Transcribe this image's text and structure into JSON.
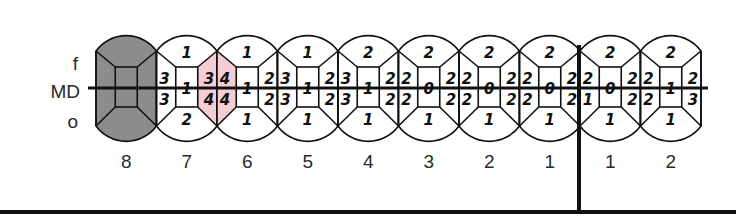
{
  "diagram": {
    "type": "dental-surface-chart",
    "row_labels": {
      "top": "f",
      "middle": "MD",
      "bottom": "o"
    },
    "colors": {
      "missing_fill": "#8c8c8c",
      "highlight_fill": "#f6cdd5",
      "stroke": "#111111",
      "background": "#ffffff"
    },
    "teeth": [
      {
        "label": "8",
        "missing": true
      },
      {
        "label": "7",
        "f": "1",
        "left_top": "3",
        "left_bottom": "3",
        "center": "1",
        "right_top": "3",
        "right_bottom": "4",
        "o": "2",
        "right_highlight": true
      },
      {
        "label": "6",
        "f": "1",
        "left_top": "4",
        "left_bottom": "4",
        "center": "1",
        "right_top": "2",
        "right_bottom": "2",
        "o": "1",
        "left_highlight": true
      },
      {
        "label": "5",
        "f": "1",
        "left_top": "3",
        "left_bottom": "3",
        "center": "1",
        "right_top": "2",
        "right_bottom": "2",
        "o": "1"
      },
      {
        "label": "4",
        "f": "2",
        "left_top": "3",
        "left_bottom": "3",
        "center": "1",
        "right_top": "2",
        "right_bottom": "2",
        "o": "1"
      },
      {
        "label": "3",
        "f": "2",
        "left_top": "2",
        "left_bottom": "2",
        "center": "0",
        "right_top": "2",
        "right_bottom": "2",
        "o": "1"
      },
      {
        "label": "2",
        "f": "2",
        "left_top": "2",
        "left_bottom": "2",
        "center": "0",
        "right_top": "2",
        "right_bottom": "2",
        "o": "1"
      },
      {
        "label": "1",
        "f": "2",
        "left_top": "2",
        "left_bottom": "2",
        "center": "0",
        "right_top": "2",
        "right_bottom": "2",
        "o": "1"
      },
      {
        "label": "1",
        "f": "2",
        "left_top": "2",
        "left_bottom": "1",
        "center": "0",
        "right_top": "2",
        "right_bottom": "2",
        "o": "1"
      },
      {
        "label": "2",
        "f": "2",
        "left_top": "2",
        "left_bottom": "2",
        "center": "1",
        "right_top": "2",
        "right_bottom": "3",
        "o": "1"
      }
    ]
  }
}
